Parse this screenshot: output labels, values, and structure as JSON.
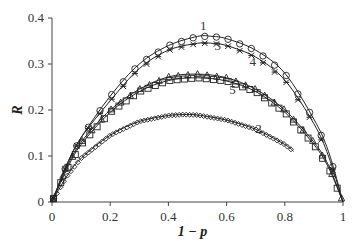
{
  "chart_data": {
    "type": "line",
    "title": "",
    "xlabel": "1 − p",
    "ylabel": "R",
    "xlim": [
      0,
      1
    ],
    "ylim": [
      0,
      0.4
    ],
    "xticks": [
      "0",
      "0.2",
      "0.4",
      "0.6",
      "0.8",
      "1"
    ],
    "yticks": [
      "0",
      "0.1",
      "0.2",
      "0.3",
      "0.4"
    ],
    "grid": false,
    "legend": "inline curve labels",
    "series": [
      {
        "name": "1",
        "marker": "circle",
        "peak": [
          0.53,
          0.36
        ],
        "x": [
          0,
          0.05,
          0.1,
          0.2,
          0.3,
          0.4,
          0.5,
          0.55,
          0.6,
          0.7,
          0.8,
          0.9,
          0.95,
          1.0
        ],
        "y": [
          0,
          0.08,
          0.14,
          0.23,
          0.3,
          0.34,
          0.36,
          0.36,
          0.355,
          0.33,
          0.28,
          0.18,
          0.11,
          0
        ]
      },
      {
        "name": "3",
        "marker": "asterisk",
        "peak": [
          0.53,
          0.345
        ],
        "x": [
          0,
          0.05,
          0.1,
          0.2,
          0.3,
          0.4,
          0.5,
          0.55,
          0.6,
          0.7,
          0.8,
          0.9,
          0.95,
          1.0
        ],
        "y": [
          0,
          0.08,
          0.14,
          0.22,
          0.29,
          0.33,
          0.345,
          0.345,
          0.34,
          0.315,
          0.265,
          0.17,
          0.1,
          0
        ]
      },
      {
        "name": "4",
        "marker": "triangle",
        "peak": [
          0.5,
          0.278
        ],
        "x": [
          0,
          0.05,
          0.1,
          0.2,
          0.3,
          0.4,
          0.5,
          0.6,
          0.7,
          0.8,
          0.9,
          0.95,
          1.0
        ],
        "y": [
          0,
          0.075,
          0.13,
          0.2,
          0.245,
          0.272,
          0.278,
          0.27,
          0.245,
          0.2,
          0.13,
          0.08,
          0
        ]
      },
      {
        "name": "5",
        "marker": "square",
        "peak": [
          0.5,
          0.27
        ],
        "x": [
          0,
          0.05,
          0.1,
          0.2,
          0.3,
          0.4,
          0.5,
          0.6,
          0.7,
          0.8,
          0.9,
          0.95,
          1.0
        ],
        "y": [
          0,
          0.07,
          0.125,
          0.195,
          0.24,
          0.264,
          0.27,
          0.263,
          0.24,
          0.195,
          0.125,
          0.075,
          0
        ]
      },
      {
        "name": "2",
        "marker": "diamond",
        "peak": [
          0.45,
          0.19
        ],
        "x": [
          0,
          0.05,
          0.1,
          0.2,
          0.3,
          0.4,
          0.45,
          0.5,
          0.6,
          0.7,
          0.8,
          0.83
        ],
        "y": [
          0,
          0.055,
          0.095,
          0.145,
          0.175,
          0.188,
          0.19,
          0.189,
          0.178,
          0.158,
          0.125,
          0.11
        ]
      }
    ],
    "annotations": [
      {
        "text": "1",
        "x": 0.52,
        "y": 0.375
      },
      {
        "text": "3",
        "x": 0.57,
        "y": 0.33
      },
      {
        "text": "4",
        "x": 0.69,
        "y": 0.295
      },
      {
        "text": "5",
        "x": 0.62,
        "y": 0.235
      },
      {
        "text": "2",
        "x": 0.71,
        "y": 0.15
      }
    ]
  }
}
